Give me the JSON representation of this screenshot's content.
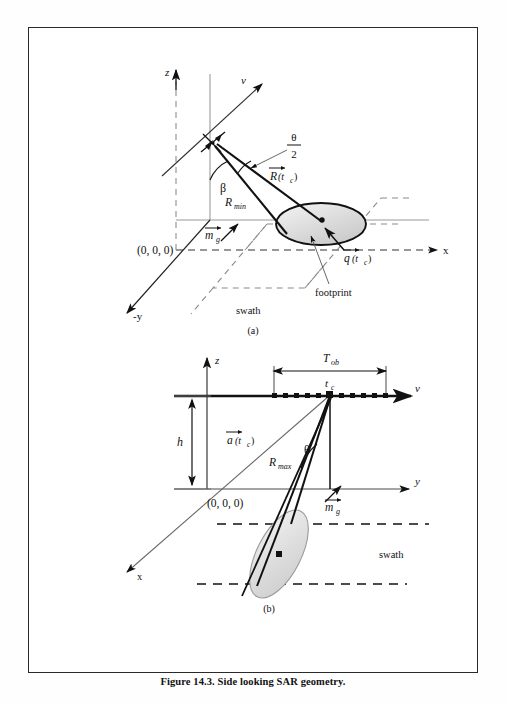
{
  "figure": {
    "caption": "Figure 14.3. Side looking SAR geometry.",
    "subfigure_a_label": "(a)",
    "subfigure_b_label": "(b)"
  },
  "panel_a": {
    "axes": {
      "z_label": "z",
      "x_label": "x",
      "neg_y_label": "-y",
      "velocity_label": "v"
    },
    "origin_label": "(0, 0, 0)",
    "angles": {
      "beta": "β",
      "theta_half_numerator": "θ",
      "theta_half_denominator": "2"
    },
    "vectors": {
      "r_min": "R",
      "r_min_sub": "min",
      "r_of_tc": "R",
      "r_of_tc_args": "(t",
      "r_of_tc_sub": "c",
      "r_of_tc_close": ")",
      "m_g": "m",
      "m_g_sub": "g",
      "q_of_tc": "q",
      "q_of_tc_args": "(t",
      "q_of_tc_sub": "c",
      "q_of_tc_close": ")"
    },
    "annotations": {
      "footprint": "footprint",
      "swath": "swath"
    },
    "icons": {
      "platform": "radar-platform-icon"
    }
  },
  "panel_b": {
    "axes": {
      "z_label": "z",
      "y_label": "y",
      "x_label": "x",
      "velocity_label": "v"
    },
    "origin_label": "(0, 0, 0)",
    "height_label": "h",
    "observation": {
      "t_ob": "T",
      "t_ob_sub": "ob",
      "t_c": "t",
      "t_c_sub": "c"
    },
    "vectors": {
      "a_of_tc": "a",
      "a_of_tc_args": "(t",
      "a_of_tc_sub": "c",
      "a_of_tc_close": ")",
      "r_max": "R",
      "r_max_sub": "max",
      "m_g": "m",
      "m_g_sub": "g"
    },
    "angles": {
      "theta": "θ"
    },
    "annotations": {
      "swath": "swath"
    },
    "track_samples": {
      "count": 11,
      "center_index": 5
    }
  },
  "colors": {
    "ink": "#111111",
    "frame": "#2a2a2a",
    "footprint_fill": "#d8d8d8",
    "footprint_fill_light": "#f0f0f0",
    "paper": "#ffffff",
    "axis_gray": "#8a8a8a"
  }
}
